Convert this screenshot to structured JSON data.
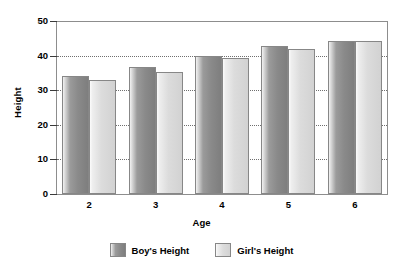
{
  "chart_data": {
    "type": "bar",
    "title": "",
    "xlabel": "Age",
    "ylabel": "Height",
    "categories": [
      "2",
      "3",
      "4",
      "5",
      "6"
    ],
    "series": [
      {
        "name": "Boy's Height",
        "values": [
          34,
          36.7,
          39.8,
          42.8,
          44.2
        ],
        "color": "#8a8a8a"
      },
      {
        "name": "Girl's Height",
        "values": [
          33,
          35.3,
          39.3,
          41.9,
          44.2
        ],
        "color": "#dcdcdc"
      }
    ],
    "ylim": [
      0,
      50
    ],
    "yticks": [
      0,
      10,
      20,
      30,
      40,
      50
    ],
    "ytick_labels": [
      "0",
      "10",
      "20",
      "30",
      "40",
      "50"
    ],
    "grid": true,
    "grid_axis": "y",
    "legend_position": "bottom",
    "legend": [
      "Boy's Height",
      "Girl's Height"
    ]
  }
}
